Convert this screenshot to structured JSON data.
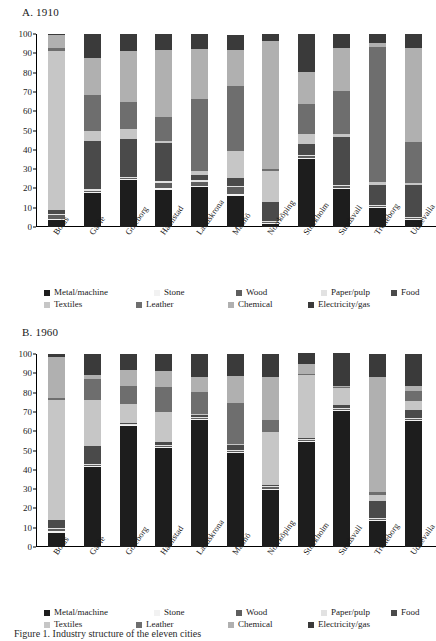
{
  "figure": {
    "caption_fragment": "Figure 1. Industry structure of the eleven cities"
  },
  "series_defs": [
    {
      "key": "metal",
      "label": "Metal/machine",
      "color": "#1d1d1d"
    },
    {
      "key": "stone",
      "label": "Stone",
      "color": "#f2f2f2"
    },
    {
      "key": "wood",
      "label": "Wood",
      "color": "#5e5e5e"
    },
    {
      "key": "paper",
      "label": "Paper/pulp",
      "color": "#e2e2e2"
    },
    {
      "key": "food",
      "label": "Food",
      "color": "#4a4a4a"
    },
    {
      "key": "textiles",
      "label": "Textiles",
      "color": "#c6c6c6"
    },
    {
      "key": "leather",
      "label": "Leather",
      "color": "#6e6e6e"
    },
    {
      "key": "chemical",
      "label": "Chemical",
      "color": "#b0b0b0"
    },
    {
      "key": "electricity",
      "label": "Electricity/gas",
      "color": "#3a3a3a"
    }
  ],
  "legend": {
    "row1": [
      "Metal/machine",
      "Stone",
      "Wood",
      "Paper/pulp",
      "Food"
    ],
    "row2": [
      "Textiles",
      "Leather",
      "Chemical",
      "Electricity/gas"
    ]
  },
  "chart_data": [
    {
      "type": "bar",
      "stacked": true,
      "title": "A. 1910",
      "xlabel": "",
      "ylabel": "",
      "ylim": [
        0,
        100
      ],
      "yticks": [
        0,
        10,
        20,
        30,
        40,
        50,
        60,
        70,
        80,
        90,
        100
      ],
      "grid": false,
      "legend_position": "bottom",
      "categories": [
        "Borås",
        "Gävle",
        "Göteborg",
        "Halmstad",
        "Landskrona",
        "Malmö",
        "Norrköping",
        "Stockholm",
        "Sundsvall",
        "Trelleborg",
        "Uddevalla"
      ],
      "series": [
        {
          "name": "Metal/machine",
          "values": [
            3.5,
            17.5,
            24.5,
            19.0,
            21.0,
            16.0,
            1.5,
            35.5,
            19.5,
            10.0,
            3.5
          ]
        },
        {
          "name": "Stone",
          "values": [
            0.5,
            0.5,
            0.5,
            1.0,
            0.5,
            1.0,
            0.5,
            0.5,
            0.5,
            0.5,
            0.5
          ]
        },
        {
          "name": "Wood",
          "values": [
            2.0,
            0.5,
            0.5,
            3.0,
            2.0,
            3.5,
            0.5,
            1.0,
            1.5,
            0.5,
            0.5
          ]
        },
        {
          "name": "Paper/pulp",
          "values": [
            1.0,
            1.0,
            0.5,
            1.0,
            1.0,
            0.5,
            0.5,
            0.5,
            0.5,
            0.5,
            0.5
          ]
        },
        {
          "name": "Food",
          "values": [
            2.0,
            25.0,
            19.5,
            19.5,
            2.5,
            4.5,
            10.0,
            5.5,
            24.5,
            10.5,
            17.0
          ]
        },
        {
          "name": "Textiles",
          "values": [
            82.0,
            5.5,
            5.5,
            1.0,
            2.0,
            14.0,
            16.0,
            5.0,
            1.5,
            1.5,
            1.0
          ]
        },
        {
          "name": "Leather",
          "values": [
            2.0,
            18.5,
            14.0,
            12.5,
            37.5,
            33.5,
            1.0,
            15.5,
            22.5,
            70.0,
            21.0
          ]
        },
        {
          "name": "Chemical",
          "values": [
            6.5,
            19.0,
            26.0,
            34.5,
            25.5,
            18.5,
            66.5,
            17.0,
            22.0,
            2.0,
            49.0
          ]
        },
        {
          "name": "Electricity/gas",
          "values": [
            0.5,
            12.5,
            9.0,
            8.5,
            8.0,
            8.0,
            3.5,
            19.5,
            7.5,
            4.5,
            7.0
          ]
        }
      ]
    },
    {
      "type": "bar",
      "stacked": true,
      "title": "B. 1960",
      "xlabel": "",
      "ylabel": "",
      "ylim": [
        0,
        100
      ],
      "yticks": [
        0,
        10,
        20,
        30,
        40,
        50,
        60,
        70,
        80,
        90,
        100
      ],
      "grid": false,
      "legend_position": "bottom",
      "categories": [
        "Borås",
        "Gävle",
        "Göteborg",
        "Halmstad",
        "Landskrona",
        "Malmö",
        "Norrköping",
        "Stockholm",
        "Sundsvall",
        "Trelleborg",
        "Uddevalla"
      ],
      "series": [
        {
          "name": "Metal/machine",
          "values": [
            7.5,
            41.5,
            62.5,
            51.5,
            66.0,
            48.5,
            29.5,
            54.5,
            70.5,
            13.5,
            65.5
          ]
        },
        {
          "name": "Stone",
          "values": [
            1.0,
            0.5,
            0.5,
            0.5,
            0.5,
            0.5,
            0.5,
            0.5,
            0.5,
            0.5,
            0.5
          ]
        },
        {
          "name": "Wood",
          "values": [
            1.0,
            0.5,
            0.5,
            0.5,
            0.5,
            1.0,
            1.0,
            0.5,
            0.5,
            0.5,
            0.5
          ]
        },
        {
          "name": "Paper/pulp",
          "values": [
            0.5,
            0.5,
            0.5,
            0.5,
            0.5,
            0.5,
            0.5,
            0.5,
            0.5,
            0.5,
            0.5
          ]
        },
        {
          "name": "Food",
          "values": [
            4.0,
            9.5,
            0.5,
            1.5,
            1.0,
            2.5,
            0.5,
            0.5,
            1.5,
            9.0,
            4.0
          ]
        },
        {
          "name": "Textiles",
          "values": [
            62.0,
            23.5,
            9.5,
            15.5,
            0.5,
            0.5,
            27.5,
            32.5,
            9.0,
            3.0,
            4.5
          ]
        },
        {
          "name": "Leather",
          "values": [
            1.0,
            11.0,
            9.5,
            13.0,
            11.5,
            21.0,
            6.5,
            0.5,
            0.5,
            1.5,
            5.5
          ]
        },
        {
          "name": "Chemical",
          "values": [
            21.5,
            2.0,
            8.0,
            8.0,
            7.5,
            14.0,
            22.0,
            5.5,
            0.5,
            59.5,
            2.5
          ]
        },
        {
          "name": "Electricity/gas",
          "values": [
            1.5,
            11.0,
            8.5,
            9.0,
            12.0,
            11.5,
            12.0,
            5.5,
            17.0,
            12.0,
            16.5
          ]
        }
      ]
    }
  ]
}
